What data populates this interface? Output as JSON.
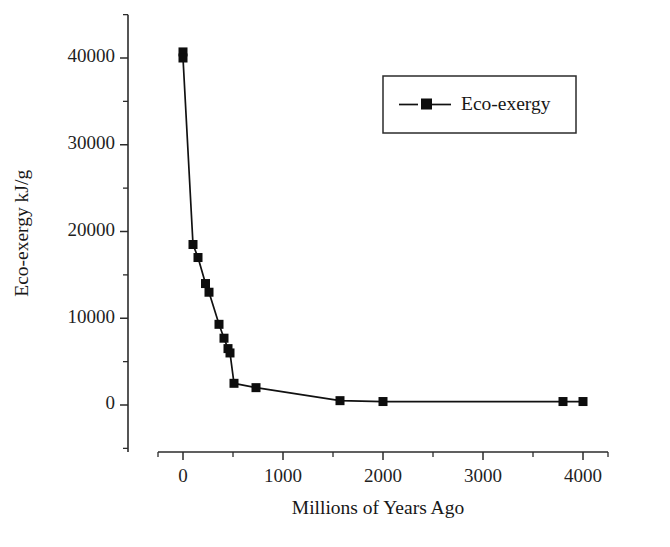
{
  "chart_data": {
    "type": "line",
    "title": "",
    "xlabel": "Millions of Years Ago",
    "ylabel": "Eco-exergy kJ/g",
    "xlim": [
      -250,
      4250
    ],
    "ylim": [
      -5000,
      45000
    ],
    "xticks": [
      0,
      1000,
      2000,
      3000,
      4000
    ],
    "xtick_labels": [
      "0",
      "1000",
      "2000",
      "3000",
      "4000"
    ],
    "yticks": [
      0,
      10000,
      20000,
      30000,
      40000
    ],
    "ytick_labels": [
      "0",
      "10000",
      "20000",
      "30000",
      "40000"
    ],
    "xminor_ticks": [
      -250,
      500,
      1500,
      2500,
      3500,
      4250
    ],
    "yminor_ticks": [
      -5000,
      5000,
      15000,
      25000,
      35000,
      45000
    ],
    "grid": false,
    "legend_position": "upper right",
    "series": [
      {
        "name": "Eco-exergy",
        "marker": "square",
        "color": "#0d0d0d",
        "x": [
          0,
          0,
          100,
          150,
          225,
          260,
          360,
          410,
          450,
          470,
          510,
          730,
          1570,
          2000,
          3800,
          4000
        ],
        "values": [
          40700,
          40000,
          18500,
          17000,
          14000,
          13000,
          9300,
          7700,
          6500,
          6000,
          2500,
          2000,
          500,
          400,
          400,
          400
        ]
      }
    ]
  },
  "legend": {
    "entries": [
      {
        "label": "Eco-exergy"
      }
    ]
  }
}
